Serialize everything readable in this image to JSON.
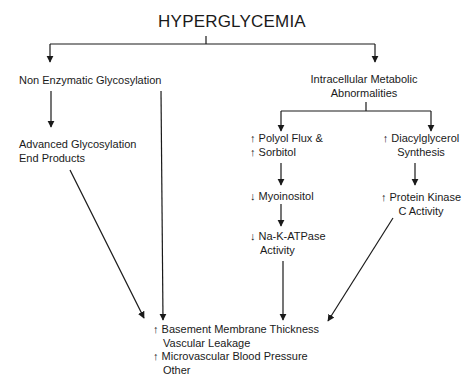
{
  "title": "HYPERGLYCEMIA",
  "nodes": {
    "non_enzymatic": "Non Enzymatic Glycosylation",
    "intracellular_1": "Intracellular Metabolic",
    "intracellular_2": "Abnormalities",
    "age_1": "Advanced Glycosylation",
    "age_2": "End Products",
    "polyol_1": "↑ Polyol Flux &",
    "polyol_2": "↑ Sorbitol",
    "myoinositol": "↓ Myoinositol",
    "atpase_1": "↓ Na-K-ATPase",
    "atpase_2": "Activity",
    "dag_1": "↑ Diacylglycerol",
    "dag_2": "Synthesis",
    "pkc_1": "↑ Protein Kinase",
    "pkc_2": "C Activity"
  },
  "outcomes": [
    "↑ Basement Membrane Thickness",
    "Vascular Leakage",
    "↑ Microvascular Blood Pressure",
    "Other"
  ],
  "colors": {
    "ink": "#1a1a1a",
    "background": "#ffffff"
  }
}
